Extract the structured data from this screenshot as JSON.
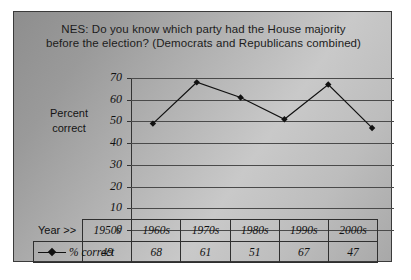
{
  "chart_data": {
    "type": "line",
    "title": "NES:  Do you know which party had the House majority before the election? (Democrats and Republicans combined)",
    "title_line1": "NES:  Do you know which party had the House majority",
    "title_line2": "before the election? (Democrats and Republicans combined)",
    "ylabel_line1": "Percent",
    "ylabel_line2": "correct",
    "xlabel": "Year >>",
    "categories": [
      "1950s",
      "1960s",
      "1970s",
      "1980s",
      "1990s",
      "2000s"
    ],
    "series": [
      {
        "name": "% correct",
        "values": [
          49,
          68,
          61,
          51,
          67,
          47
        ]
      }
    ],
    "ylim": [
      0,
      70
    ],
    "ytick_labels": [
      "70",
      "60",
      "50",
      "40",
      "30",
      "20",
      "10",
      "0"
    ],
    "ytick_values": [
      70,
      60,
      50,
      40,
      30,
      20,
      10,
      0
    ],
    "ystep": 10,
    "grid": true,
    "legend_position": "table-row",
    "marker": "diamond",
    "colors": {
      "line": "#111111",
      "marker": "#111111",
      "grid": "#4a4a4a",
      "axis": "#333333",
      "text": "#111111",
      "border": "#2f2f2f",
      "background": "#b4b4b4"
    }
  },
  "table": {
    "row_header_label": "Year >>",
    "series_label": "% correct",
    "columns": [
      "1950s",
      "1960s",
      "1970s",
      "1980s",
      "1990s",
      "2000s"
    ],
    "values": [
      "49",
      "68",
      "61",
      "51",
      "67",
      "47"
    ]
  }
}
